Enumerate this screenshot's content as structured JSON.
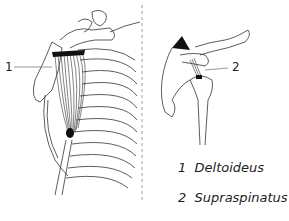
{
  "figure": {
    "left_panel": {
      "label_number": "1"
    },
    "right_panel": {
      "label_number": "2"
    },
    "legend": [
      {
        "number": "1",
        "name": "Deltoideus"
      },
      {
        "number": "2",
        "name": "Supraspinatus"
      }
    ]
  }
}
